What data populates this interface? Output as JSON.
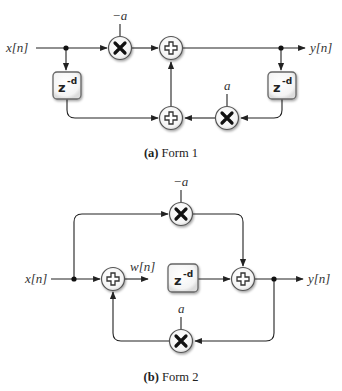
{
  "figure_a": {
    "caption_tag": "(a)",
    "caption_text": " Form 1",
    "input_label": "x[n]",
    "output_label": "y[n]",
    "top_multiplier_coef": "−a",
    "bottom_multiplier_coef": "a",
    "delay_base": "z",
    "delay_exp": "-d"
  },
  "figure_b": {
    "caption_tag": "(b)",
    "caption_text": " Form 2",
    "input_label": "x[n]",
    "output_label": "y[n]",
    "internal_label": "w[n]",
    "top_multiplier_coef": "−a",
    "bottom_multiplier_coef": "a",
    "delay_base": "z",
    "delay_exp": "-d"
  },
  "colors": {
    "wire": "#222222",
    "node_fill": "#ffffff",
    "node_stroke": "#555555"
  }
}
